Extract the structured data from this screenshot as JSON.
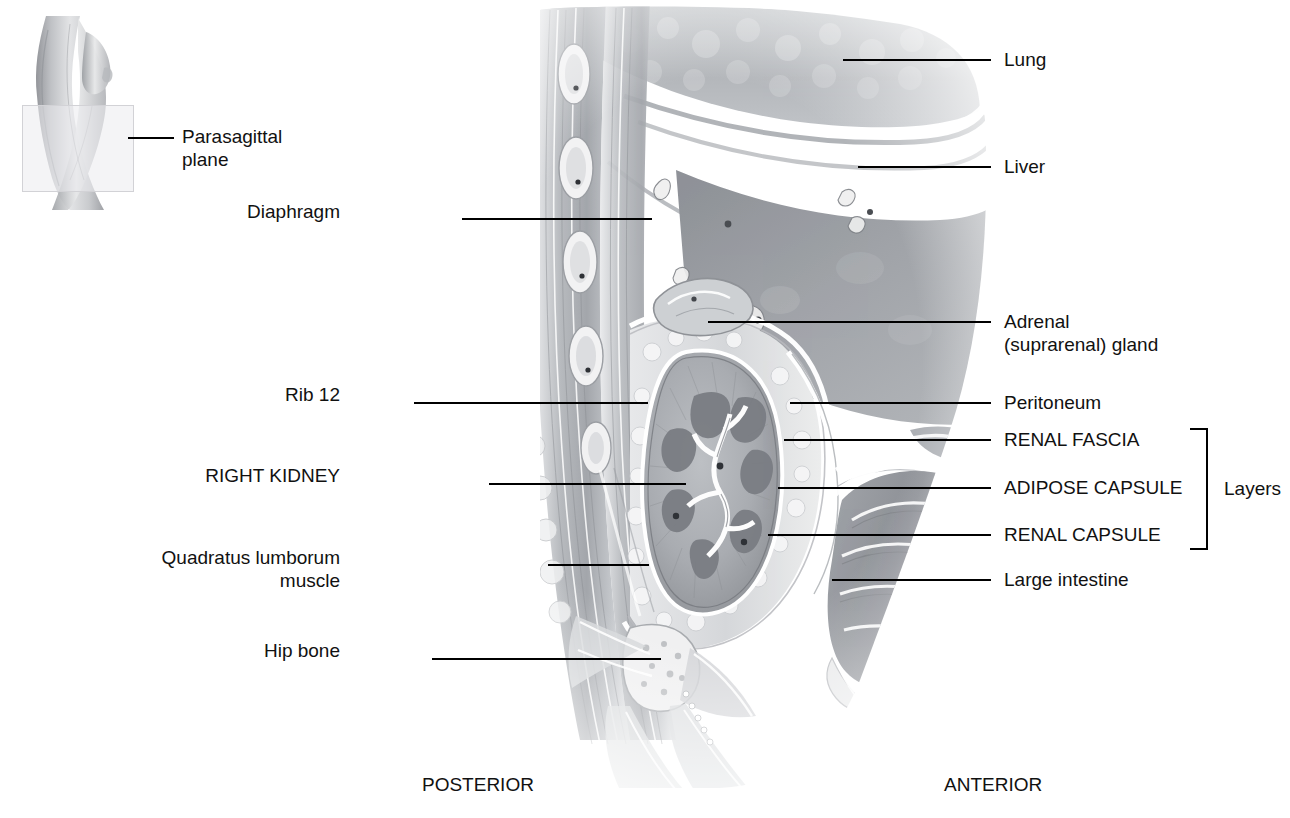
{
  "figure": {
    "orientation": {
      "posterior": "POSTERIOR",
      "anterior": "ANTERIOR"
    },
    "bracket_label": "Layers"
  },
  "inset": {
    "label_line1": "Parasagittal",
    "label_line2": "plane",
    "icon": "body-torso-figure"
  },
  "labels_left": [
    {
      "id": "diaphragm",
      "text": "Diaphragm",
      "x": 340,
      "y": 211,
      "line_x1": 462,
      "line_x2": 652,
      "line_y": 219
    },
    {
      "id": "rib12",
      "text": "Rib 12",
      "x": 340,
      "y": 394,
      "line_x1": 414,
      "line_x2": 648,
      "line_y": 403
    },
    {
      "id": "right-kidney",
      "text": "RIGHT KIDNEY",
      "x": 340,
      "y": 475,
      "line_x1": 489,
      "line_x2": 686,
      "line_y": 484
    },
    {
      "id": "quadratus",
      "text": "Quadratus lumborum\nmuscle",
      "x": 340,
      "y": 557,
      "line_x1": 548,
      "line_x2": 649,
      "line_y": 565
    },
    {
      "id": "hip-bone",
      "text": "Hip bone",
      "x": 340,
      "y": 650,
      "line_x1": 432,
      "line_x2": 661,
      "line_y": 659
    }
  ],
  "labels_right": [
    {
      "id": "lung",
      "text": "Lung",
      "x": 1004,
      "y": 48,
      "line_x1": 843,
      "line_x2": 991,
      "line_y": 60
    },
    {
      "id": "liver",
      "text": "Liver",
      "x": 1004,
      "y": 156,
      "line_x1": 858,
      "line_x2": 991,
      "line_y": 167
    },
    {
      "id": "adrenal",
      "text": "Adrenal\n(suprarenal) gland",
      "x": 1004,
      "y": 311,
      "line_x1": 708,
      "line_x2": 991,
      "line_y": 322
    },
    {
      "id": "peritoneum",
      "text": "Peritoneum",
      "x": 1004,
      "y": 392,
      "line_x1": 790,
      "line_x2": 991,
      "line_y": 403
    },
    {
      "id": "renal-fascia",
      "text": "RENAL FASCIA",
      "x": 1004,
      "y": 429,
      "line_x1": 784,
      "line_x2": 991,
      "line_y": 440
    },
    {
      "id": "adipose-capsule",
      "text": "ADIPOSE CAPSULE",
      "x": 1004,
      "y": 477,
      "line_x1": 778,
      "line_x2": 991,
      "line_y": 488
    },
    {
      "id": "renal-capsule",
      "text": "RENAL CAPSULE",
      "x": 1004,
      "y": 524,
      "line_x1": 768,
      "line_x2": 991,
      "line_y": 535
    },
    {
      "id": "large-intestine",
      "text": "Large intestine",
      "x": 1004,
      "y": 569,
      "line_x1": 832,
      "line_x2": 991,
      "line_y": 580
    }
  ],
  "bracket": {
    "x": 1206,
    "y_top": 428,
    "y_bottom": 549,
    "arm": 16,
    "label_x": 1230,
    "label_y": 477
  },
  "colors": {
    "ink": "#000000",
    "lung": "#b9bcc0",
    "liver": "#9a9da2",
    "muscle": "#a8abaf",
    "kidney_cortex": "#acafb4",
    "kidney_medulla": "#85888e",
    "fat": "#d9dadd",
    "intestine": "#9ea1a6",
    "plane_box": "#ebebee"
  }
}
